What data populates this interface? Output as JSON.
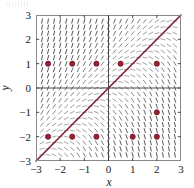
{
  "figure": {
    "kind": "slope-field-plot",
    "background_color": "#ffffff",
    "frame": {
      "color": "#8a8a8a",
      "x_pixels": [
        36,
        181
      ],
      "y_pixels": [
        15,
        161
      ]
    },
    "axis_line_color": "#3a3a3a",
    "xlabel": "x",
    "ylabel": "y",
    "x_ticks": [
      "-3",
      "-2",
      "-1",
      "0",
      "1",
      "2",
      "3"
    ],
    "y_ticks": [
      "3",
      "2",
      "1",
      "0",
      "-1",
      "-2",
      "-3"
    ]
  },
  "chart_data": {
    "type": "scatter",
    "title": "",
    "xlabel": "x",
    "ylabel": "y",
    "xlim": [
      -3,
      3
    ],
    "ylim": [
      -3,
      3
    ],
    "grid": false,
    "legend": "none",
    "x_ticks": [
      -3,
      -2,
      -1,
      0,
      1,
      2,
      3
    ],
    "y_ticks": [
      -3,
      -2,
      -1,
      0,
      1,
      2,
      3
    ],
    "x_tick_labels": [
      "-3",
      "-2",
      "-1",
      "0",
      "1",
      "2",
      "3"
    ],
    "y_tick_labels": [
      "-3",
      "-2",
      "-1",
      "0",
      "1",
      "2",
      "3"
    ],
    "slope_field": {
      "description": "direction field of dy/dx proportional to (y - x)",
      "segment_color": "#4a4a4a",
      "x_start": -2.75,
      "x_step": 0.25,
      "x_count": 23,
      "y_start": -2.75,
      "y_step": 0.25,
      "y_count": 23,
      "segment_length_px": 5.2
    },
    "reference_line": {
      "name": "y = x",
      "color": "#7d1f33",
      "from": [
        -3,
        -3
      ],
      "to": [
        3,
        3
      ],
      "width": 1.6
    },
    "points": {
      "name": "marked solutions",
      "color": "#9b2033",
      "edge_color": "#5e1220",
      "radius_px": 2.6,
      "values": [
        [
          -2.5,
          1
        ],
        [
          -1.5,
          1
        ],
        [
          -0.5,
          1
        ],
        [
          0.5,
          1
        ],
        [
          2,
          1
        ],
        [
          2,
          -1
        ],
        [
          -2.5,
          -2
        ],
        [
          -1.5,
          -2
        ],
        [
          -0.5,
          -2
        ],
        [
          1,
          -2
        ],
        [
          2,
          -2
        ]
      ]
    }
  }
}
